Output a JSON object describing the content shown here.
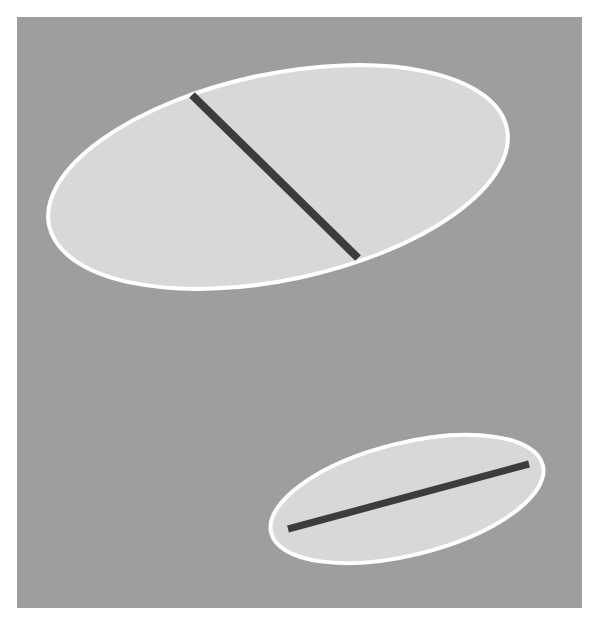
{
  "figure": {
    "canvas": {
      "width": 599,
      "height": 627,
      "page_background_color": "#ffffff"
    },
    "plot_area": {
      "name": "gray-backdrop-panel",
      "x": 17,
      "y": 17,
      "width": 565,
      "height": 591,
      "fill_color": "#9e9e9e"
    },
    "shape_style": {
      "ellipse_fill_color": "#d8d8d8",
      "ellipse_stroke_color": "#ffffff",
      "ellipse_stroke_width": 4,
      "line_color": "#3c3c3c"
    },
    "shapes": [
      {
        "name": "large-ellipse",
        "label": "Large ellipse",
        "center_x": 278,
        "center_y": 177,
        "radius_x": 234,
        "radius_y": 103,
        "rotation_deg": -12,
        "fill_color": "#d8d8d8",
        "stroke_color": "#ffffff",
        "stroke_width": 4
      },
      {
        "name": "small-ellipse",
        "label": "Small ellipse",
        "center_x": 407,
        "center_y": 499,
        "radius_x": 140,
        "radius_y": 56,
        "rotation_deg": -14,
        "fill_color": "#d8d8d8",
        "stroke_color": "#ffffff",
        "stroke_width": 4
      }
    ],
    "lines": [
      {
        "name": "large-ellipse-chord-line",
        "label": "Chord line inside large ellipse",
        "x1": 192,
        "y1": 95,
        "x2": 358,
        "y2": 258,
        "stroke_color": "#3c3c3c",
        "stroke_width": 8,
        "angle_deg": 44.5
      },
      {
        "name": "small-ellipse-chord-line",
        "label": "Chord line inside small ellipse",
        "x1": 288,
        "y1": 529,
        "x2": 529,
        "y2": 464,
        "stroke_color": "#3c3c3c",
        "stroke_width": 7,
        "angle_deg": -15.1
      }
    ]
  },
  "chart_data": {
    "type": "scatter",
    "xlabel": "",
    "ylabel": "",
    "xlim": [
      0,
      599
    ],
    "ylim": [
      627,
      0
    ],
    "grid": false,
    "legend": "none",
    "series": [
      {
        "name": "large-ellipse",
        "shape": "ellipse",
        "center": [
          278,
          177
        ],
        "radii": [
          234,
          103
        ],
        "rotation_deg": -12,
        "fill": "#d8d8d8",
        "edge": "#ffffff"
      },
      {
        "name": "large-ellipse-chord-line",
        "shape": "line",
        "x": [
          192,
          358
        ],
        "y": [
          95,
          258
        ],
        "color": "#3c3c3c",
        "linewidth": 8
      },
      {
        "name": "small-ellipse",
        "shape": "ellipse",
        "center": [
          407,
          499
        ],
        "radii": [
          140,
          56
        ],
        "rotation_deg": -14,
        "fill": "#d8d8d8",
        "edge": "#ffffff"
      },
      {
        "name": "small-ellipse-chord-line",
        "shape": "line",
        "x": [
          288,
          529
        ],
        "y": [
          529,
          464
        ],
        "color": "#3c3c3c",
        "linewidth": 7
      }
    ],
    "annotations": []
  }
}
